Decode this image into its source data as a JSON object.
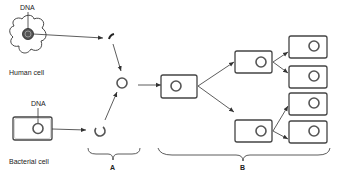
{
  "diagram": {
    "type": "recombinant DNA / gene cloning",
    "labels": {
      "human_dna": "DNA",
      "human_cell": "Human cell",
      "bacterial_dna": "DNA",
      "bacterial_cell": "Bacterial cell",
      "stage_a": "A",
      "stage_b": "B"
    },
    "nodes": [
      {
        "id": "human-cell",
        "label": "Human cell"
      },
      {
        "id": "human-dna-fragment",
        "label": ""
      },
      {
        "id": "bacterial-cell",
        "label": "Bacterial cell"
      },
      {
        "id": "opened-plasmid",
        "label": ""
      },
      {
        "id": "recombinant-plasmid",
        "label": ""
      },
      {
        "id": "transformed-bacterium",
        "label": ""
      },
      {
        "id": "daughter-cell-1",
        "label": ""
      },
      {
        "id": "daughter-cell-2",
        "label": ""
      },
      {
        "id": "granddaughter-cell-1",
        "label": ""
      },
      {
        "id": "granddaughter-cell-2",
        "label": ""
      },
      {
        "id": "granddaughter-cell-3",
        "label": ""
      },
      {
        "id": "granddaughter-cell-4",
        "label": ""
      }
    ],
    "colors": {
      "stroke": "#333333",
      "background": "#ffffff"
    }
  }
}
